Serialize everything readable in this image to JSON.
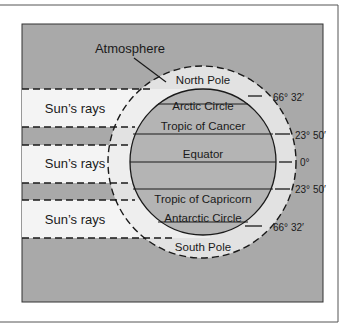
{
  "diagram": {
    "title_label": "Atmosphere",
    "sun_rays": [
      {
        "label": "Sun’s rays"
      },
      {
        "label": "Sun’s rays"
      },
      {
        "label": "Sun’s rays"
      }
    ],
    "zones": {
      "north_pole": "North Pole",
      "arctic_circle": "Arctic Circle",
      "tropic_of_cancer": "Tropic of Cancer",
      "equator": "Equator",
      "tropic_of_capricorn": "Tropic of Capricorn",
      "antarctic_circle": "Antarctic Circle",
      "south_pole": "South Pole"
    },
    "latitudes": {
      "arctic": "66° 32′",
      "cancer": "23° 50′",
      "equator": "0°",
      "capricorn": "23° 50′",
      "antarctic": "66° 32′"
    },
    "colors": {
      "background_gray": "#a9a9a9",
      "ray_band_white": "#f4f4f4",
      "atmosphere_fill": "#e2e2e2",
      "earth_fill": "#b4b4b4",
      "line": "#1a1a1a"
    }
  }
}
